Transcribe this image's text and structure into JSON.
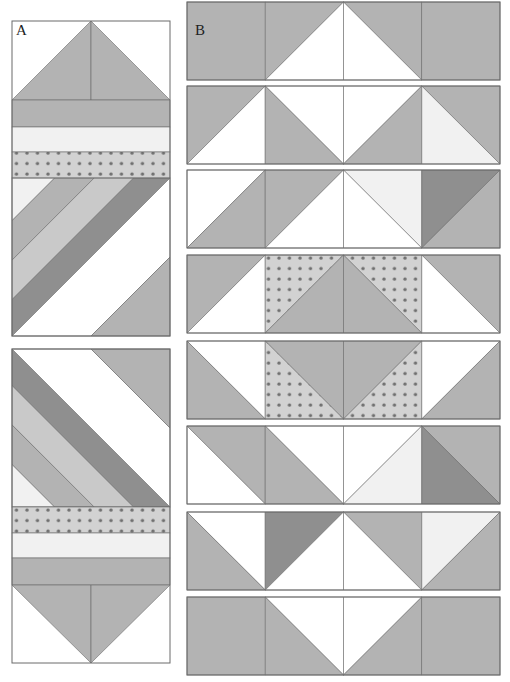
{
  "colors": {
    "white": "#ffffff",
    "vlight": "#f1f1f1",
    "light": "#c9c9c9",
    "med": "#b3b3b3",
    "dark": "#8f8f8f",
    "dotbg": "#d2d2d2",
    "dot": "#6f6f6f",
    "stroke": "#6a6a6a"
  },
  "panel_a": {
    "label": "A",
    "label_pos": [
      16,
      36
    ],
    "x": 12,
    "w": 158,
    "top_block": {
      "y": 21,
      "pieces": [
        {
          "type": "flying_geese_up",
          "h": 79,
          "bg": "white",
          "fg": "med"
        },
        {
          "type": "band",
          "h": 27,
          "fill": "med"
        },
        {
          "type": "band",
          "h": 25,
          "fill": "vlight"
        },
        {
          "type": "band_dots",
          "h": 26
        },
        {
          "type": "diag_stripes",
          "h": 158,
          "direction": "up",
          "stripes": [
            {
              "fill": "vlight",
              "t0": 0,
              "t1": 0.27
            },
            {
              "fill": "med",
              "t0": 0.27,
              "t1": 0.52
            },
            {
              "fill": "light",
              "t0": 0.52,
              "t1": 0.77
            },
            {
              "fill": "dark",
              "t0": 0.77,
              "t1": 1.0
            },
            {
              "fill": "white",
              "t0": 1.0,
              "t1": 1.5
            },
            {
              "fill": "med",
              "t0": 1.5,
              "t1": 2.0
            }
          ]
        }
      ]
    },
    "bottom_block": {
      "y": 349,
      "pieces": [
        {
          "type": "diag_stripes",
          "h": 158,
          "direction": "down",
          "stripes": [
            {
              "fill": "vlight",
              "t0": 0,
              "t1": 0.27
            },
            {
              "fill": "med",
              "t0": 0.27,
              "t1": 0.52
            },
            {
              "fill": "light",
              "t0": 0.52,
              "t1": 0.77
            },
            {
              "fill": "dark",
              "t0": 0.77,
              "t1": 1.0
            },
            {
              "fill": "white",
              "t0": 1.0,
              "t1": 1.5
            },
            {
              "fill": "med",
              "t0": 1.5,
              "t1": 2.0
            }
          ]
        },
        {
          "type": "band_dots",
          "h": 26
        },
        {
          "type": "band",
          "h": 25,
          "fill": "vlight"
        },
        {
          "type": "band",
          "h": 27,
          "fill": "med"
        },
        {
          "type": "flying_geese_down",
          "h": 78,
          "bg": "white",
          "fg": "med"
        }
      ]
    }
  },
  "panel_b": {
    "label": "B",
    "label_pos": [
      195,
      36
    ],
    "x": 187,
    "cell": 78.25,
    "h": 78,
    "rows": [
      {
        "y": 2,
        "cells": [
          {
            "t": "solid",
            "a": "med"
          },
          {
            "t": "hst",
            "diag": "bl-tr",
            "upper": "med",
            "lower": "white"
          },
          {
            "t": "hst",
            "diag": "tl-br",
            "upper": "med",
            "lower": "white"
          },
          {
            "t": "solid",
            "a": "med"
          }
        ]
      },
      {
        "y": 86,
        "cells": [
          {
            "t": "hst",
            "diag": "bl-tr",
            "upper": "med",
            "lower": "white"
          },
          {
            "t": "hst",
            "diag": "tl-br",
            "upper": "white",
            "lower": "med"
          },
          {
            "t": "hst",
            "diag": "bl-tr",
            "upper": "white",
            "lower": "med"
          },
          {
            "t": "hst",
            "diag": "tl-br",
            "upper": "med",
            "lower": "vlight"
          }
        ]
      },
      {
        "y": 170,
        "cells": [
          {
            "t": "hst",
            "diag": "bl-tr",
            "upper": "white",
            "lower": "med"
          },
          {
            "t": "hst",
            "diag": "bl-tr",
            "upper": "med",
            "lower": "white"
          },
          {
            "t": "hst",
            "diag": "tl-br",
            "upper": "vlight",
            "lower": "white"
          },
          {
            "t": "hst",
            "diag": "bl-tr",
            "upper": "dark",
            "lower": "med"
          }
        ]
      },
      {
        "y": 255,
        "cells": [
          {
            "t": "hst",
            "diag": "bl-tr",
            "upper": "med",
            "lower": "white"
          },
          {
            "t": "hst",
            "diag": "bl-tr",
            "upper": "dots",
            "lower": "med"
          },
          {
            "t": "hst",
            "diag": "tl-br",
            "upper": "dots",
            "lower": "med"
          },
          {
            "t": "hst",
            "diag": "tl-br",
            "upper": "med",
            "lower": "white"
          }
        ]
      },
      {
        "y": 341,
        "cells": [
          {
            "t": "hst",
            "diag": "tl-br",
            "upper": "white",
            "lower": "med"
          },
          {
            "t": "hst",
            "diag": "tl-br",
            "upper": "med",
            "lower": "dots"
          },
          {
            "t": "hst",
            "diag": "bl-tr",
            "upper": "med",
            "lower": "dots"
          },
          {
            "t": "hst",
            "diag": "bl-tr",
            "upper": "white",
            "lower": "med"
          }
        ]
      },
      {
        "y": 426,
        "cells": [
          {
            "t": "hst",
            "diag": "tl-br",
            "upper": "med",
            "lower": "white"
          },
          {
            "t": "hst",
            "diag": "tl-br",
            "upper": "white",
            "lower": "med"
          },
          {
            "t": "hst",
            "diag": "bl-tr",
            "upper": "white",
            "lower": "vlight"
          },
          {
            "t": "hst",
            "diag": "tl-br",
            "upper": "med",
            "lower": "dark"
          }
        ]
      },
      {
        "y": 512,
        "cells": [
          {
            "t": "hst",
            "diag": "tl-br",
            "upper": "white",
            "lower": "med"
          },
          {
            "t": "hst",
            "diag": "bl-tr",
            "upper": "dark",
            "lower": "white"
          },
          {
            "t": "hst",
            "diag": "tl-br",
            "upper": "med",
            "lower": "white"
          },
          {
            "t": "hst",
            "diag": "bl-tr",
            "upper": "vlight",
            "lower": "med"
          }
        ]
      },
      {
        "y": 597,
        "cells": [
          {
            "t": "solid",
            "a": "med"
          },
          {
            "t": "hst",
            "diag": "tl-br",
            "upper": "white",
            "lower": "med"
          },
          {
            "t": "hst",
            "diag": "bl-tr",
            "upper": "white",
            "lower": "med"
          },
          {
            "t": "solid",
            "a": "med"
          }
        ]
      }
    ]
  }
}
